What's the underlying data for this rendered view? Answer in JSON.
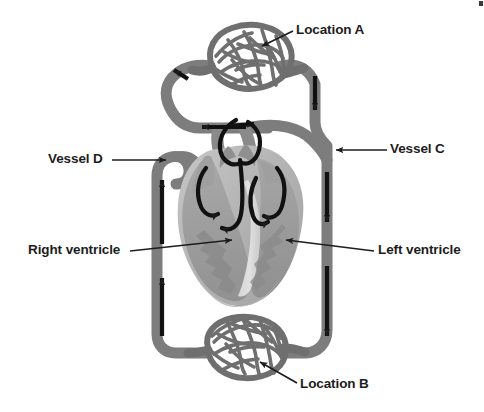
{
  "figure": {
    "background_color": "#ffffff",
    "label_color": "#1d1d1d"
  },
  "labels": {
    "location_a": "Location A",
    "location_b": "Location B",
    "vessel_c": "Vessel C",
    "vessel_d": "Vessel D",
    "right_ventricle": "Right ventricle",
    "left_ventricle": "Left ventricle"
  },
  "colors": {
    "vessel_gray": "#7d7d7d",
    "vessel_gray_dark": "#6e6e6e",
    "capillary_gray": "#6f6f6f",
    "heart_light": "#bdbdbd",
    "heart_mid": "#9a9a9a",
    "heart_dark": "#808080",
    "heart_highlight": "#d6d6d6",
    "arrow_black": "#111111",
    "leader_line": "#1d1d1d"
  },
  "structures": [
    {
      "name": "capillary-bed-top",
      "label_ref": "location_a",
      "position": "top-center"
    },
    {
      "name": "capillary-bed-bottom",
      "label_ref": "location_b",
      "position": "bottom-center"
    },
    {
      "name": "heart",
      "position": "center"
    },
    {
      "name": "vessel-left-ascending",
      "label_ref": "vessel_d",
      "flow_direction": "up",
      "arrow_count": 2
    },
    {
      "name": "vessel-right-descending",
      "label_ref": "vessel_c",
      "flow_direction": "down",
      "arrow_count": 3
    }
  ],
  "flow_arrows": {
    "left_vessel": "up",
    "right_vessel": "down",
    "top_loop": "left",
    "heart_internal": "curved"
  }
}
